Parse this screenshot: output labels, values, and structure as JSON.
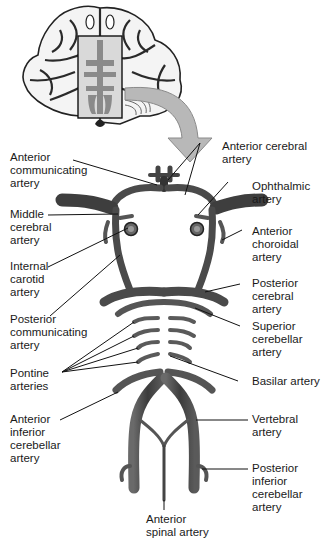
{
  "diagram": {
    "colors": {
      "vessel": "#4a4a4a",
      "vessel_dark": "#2e2e2e",
      "vessel_light": "#7a7a7a",
      "arrow": "#b5b5b5",
      "leader": "#111111",
      "brain_outline": "#222222"
    },
    "labels": {
      "anterior_communicating": [
        "Anterior",
        "communicating",
        "artery"
      ],
      "anterior_cerebral": [
        "Anterior cerebral",
        "artery"
      ],
      "ophthalmic": [
        "Ophthalmic",
        "artery"
      ],
      "middle_cerebral": [
        "Middle",
        "cerebral",
        "artery"
      ],
      "anterior_choroidal": [
        "Anterior",
        "choroidal",
        "artery"
      ],
      "internal_carotid": [
        "Internal",
        "carotid",
        "artery"
      ],
      "posterior_cerebral": [
        "Posterior",
        "cerebral",
        "artery"
      ],
      "posterior_communicating": [
        "Posterior",
        "communicating",
        "artery"
      ],
      "superior_cerebellar": [
        "Superior",
        "cerebellar",
        "artery"
      ],
      "pontine": [
        "Pontine",
        "arteries"
      ],
      "basilar": [
        "Basilar artery"
      ],
      "anterior_inferior_cerebellar": [
        "Anterior",
        "inferior",
        "cerebellar",
        "artery"
      ],
      "vertebral": [
        "Vertebral",
        "artery"
      ],
      "posterior_inferior_cerebellar": [
        "Posterior",
        "inferior",
        "cerebellar",
        "artery"
      ],
      "anterior_spinal": [
        "Anterior",
        "spinal artery"
      ]
    },
    "icons": {
      "brain": "brain-inferior-view-icon",
      "arrow": "curved-arrow-icon"
    }
  }
}
